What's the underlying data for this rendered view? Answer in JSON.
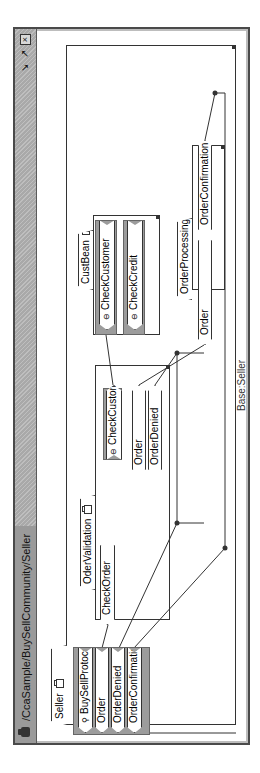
{
  "window": {
    "title": "/CcaSample/BuySellCommunity/Seller",
    "controls": {
      "minimize": "↘",
      "maximize": "↗",
      "close": "☒"
    }
  },
  "diagram": {
    "component": {
      "name": "Seller",
      "base_label": "Base:Seller"
    },
    "seller_ports": [
      {
        "label": "BuySellProtocol",
        "kind": "protocol"
      },
      {
        "label": "Order",
        "kind": "flow"
      },
      {
        "label": "OrderDenied",
        "kind": "flow"
      },
      {
        "label": "OrderConfirmation",
        "kind": "flow"
      }
    ],
    "order_validation": {
      "name": "OderValidation",
      "in_ports": [
        {
          "label": "CheckOrder"
        }
      ],
      "out_ports": [
        {
          "label": "CheckCustomer",
          "kind": "protocol"
        },
        {
          "label": "Order"
        },
        {
          "label": "OrderDenied"
        }
      ]
    },
    "cust_bean": {
      "name": "CustBean",
      "ports": [
        {
          "label": "CheckCustomer",
          "kind": "protocol"
        },
        {
          "label": "CheckCredit",
          "kind": "protocol"
        }
      ]
    },
    "order_processing": {
      "name": "OrderProcessing",
      "ports": [
        {
          "label": "Order"
        },
        {
          "label": "OrderConfirmation"
        }
      ]
    },
    "colors": {
      "port_group": "#9c9c9c",
      "titlebar": "#a9a9a9",
      "line": "#333333"
    }
  }
}
